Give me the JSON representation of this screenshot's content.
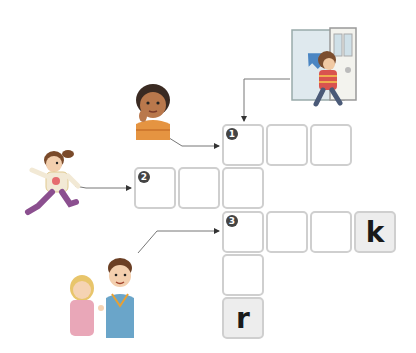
{
  "puzzle": {
    "clues": [
      {
        "number": "1",
        "direction": "across",
        "picture": "boy-opening-door-going-out"
      },
      {
        "number": "2",
        "direction": "across",
        "picture": "girl-running"
      },
      {
        "number": "3",
        "direction": "across",
        "picture": "boy-talking-to-girl"
      },
      {
        "number": "1-down-picture",
        "direction": "down",
        "picture": "boy-thinking"
      }
    ],
    "numbers": {
      "n1": "1",
      "n2": "2",
      "n3": "3"
    },
    "given_letters": {
      "row3_col4": "k",
      "col1_row5": "r"
    }
  },
  "colors": {
    "cell_border": "#cfcfcf",
    "given_cell_bg": "#ededed",
    "number_badge": "#444444",
    "line": "#555555"
  }
}
